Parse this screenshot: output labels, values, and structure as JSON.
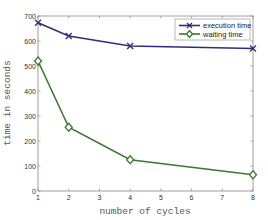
{
  "chart_data": {
    "type": "line",
    "title": "",
    "xlabel": "number of cycles",
    "ylabel": "time in seconds",
    "x": [
      1,
      2,
      4,
      8
    ],
    "xlim": [
      1,
      8
    ],
    "ylim": [
      0,
      700
    ],
    "xticks": [
      1,
      2,
      3,
      4,
      5,
      6,
      7,
      8
    ],
    "yticks": [
      0,
      100,
      200,
      300,
      400,
      500,
      600,
      700
    ],
    "grid": false,
    "legend_position": "upper right",
    "series": [
      {
        "name": "execution time",
        "values": [
          673,
          620,
          580,
          570
        ],
        "color": "#2e2e7a",
        "marker": "x"
      },
      {
        "name": "waiting time",
        "values": [
          520,
          255,
          125,
          65
        ],
        "color": "#3a7a2e",
        "marker": "diamond"
      }
    ]
  },
  "legend": {
    "items": [
      {
        "label": "execution time"
      },
      {
        "label": "waiting time"
      }
    ]
  }
}
